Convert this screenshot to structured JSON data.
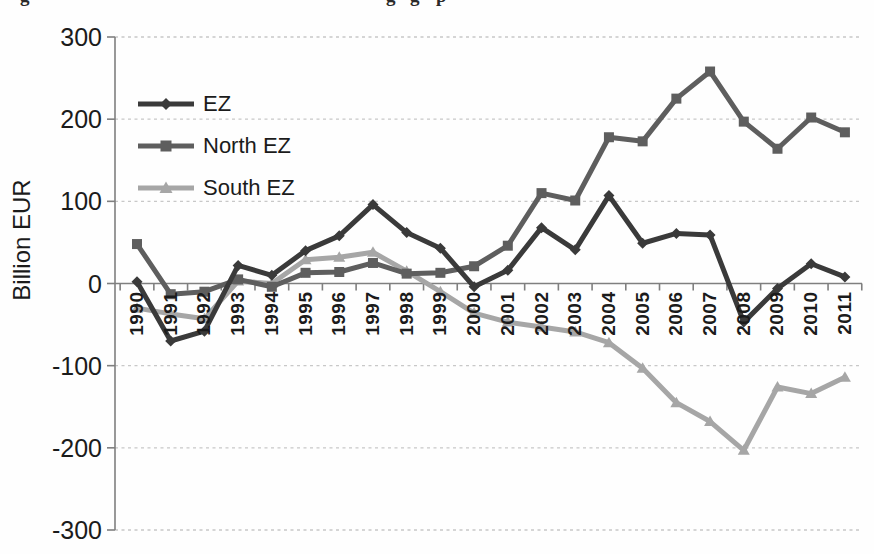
{
  "figure": {
    "cropped_caption_fragments": [
      {
        "text": "g",
        "x": 20
      },
      {
        "text": "g",
        "x": 386
      },
      {
        "text": "g",
        "x": 410
      },
      {
        "text": "p",
        "x": 436
      }
    ]
  },
  "chart_data": {
    "type": "line",
    "ylabel": "Billion EUR",
    "xlabel": "",
    "ylim": [
      -300,
      300
    ],
    "yticks": [
      300,
      200,
      100,
      0,
      -100,
      -200,
      -300
    ],
    "grid": "horizontal-dashed",
    "legend_position": "inside-top-left",
    "x_tick_label_rotation": -90,
    "axis_color": "#7f7f7f",
    "gridline_color": "#c8c8c8",
    "text_color": "#1b1b1b",
    "categories": [
      "1990",
      "1991",
      "1992",
      "1993",
      "1994",
      "1995",
      "1996",
      "1997",
      "1998",
      "1999",
      "2000",
      "2001",
      "2002",
      "2003",
      "2004",
      "2005",
      "2006",
      "2007",
      "2008",
      "2009",
      "2010",
      "2011"
    ],
    "series": [
      {
        "name": "EZ",
        "marker": "diamond",
        "color": "#3a3a3a",
        "values": [
          2,
          -70,
          -58,
          22,
          10,
          40,
          58,
          96,
          62,
          43,
          -4,
          16,
          68,
          41,
          107,
          49,
          61,
          59,
          -47,
          -6,
          24,
          8
        ]
      },
      {
        "name": "North EZ",
        "marker": "square",
        "color": "#5e5e5e",
        "values": [
          48,
          -13,
          -10,
          5,
          -4,
          13,
          14,
          25,
          12,
          13,
          21,
          46,
          110,
          101,
          178,
          173,
          225,
          258,
          197,
          164,
          202,
          184
        ]
      },
      {
        "name": "South EZ",
        "marker": "triangle",
        "color": "#a6a6a6",
        "values": [
          -30,
          -37,
          -43,
          3,
          0,
          29,
          32,
          38,
          15,
          -10,
          -36,
          -47,
          -53,
          -59,
          -72,
          -103,
          -145,
          -168,
          -203,
          -126,
          -134,
          -114
        ]
      }
    ]
  }
}
